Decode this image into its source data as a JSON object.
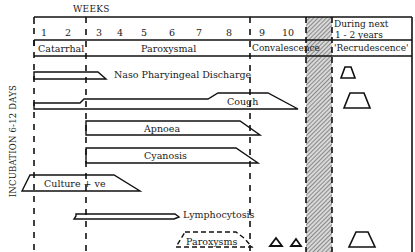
{
  "header": {
    "weeks_label": "WEEKS",
    "week_numbers": [
      "1",
      "2",
      "3",
      "4",
      "5",
      "6",
      "7",
      "8",
      "9",
      "10"
    ],
    "future_label_line1": "During next",
    "future_label_line2": "1 - 2 years"
  },
  "phases": [
    {
      "label": "Catarrhal"
    },
    {
      "label": "Paroxysmal"
    },
    {
      "label": "Convalescence"
    },
    {
      "label": "'Recrudescence'"
    }
  ],
  "side_label": "INCUBATION 6-12 DAYS",
  "rows": [
    {
      "label": "Naso Pharyingeal Discharge"
    },
    {
      "label": "Cough"
    },
    {
      "label": "Apnoea"
    },
    {
      "label": "Cyanosis"
    },
    {
      "label": "Culture + ve"
    },
    {
      "label": "Lymphocytosis"
    },
    {
      "label": "Paroxysms"
    }
  ]
}
